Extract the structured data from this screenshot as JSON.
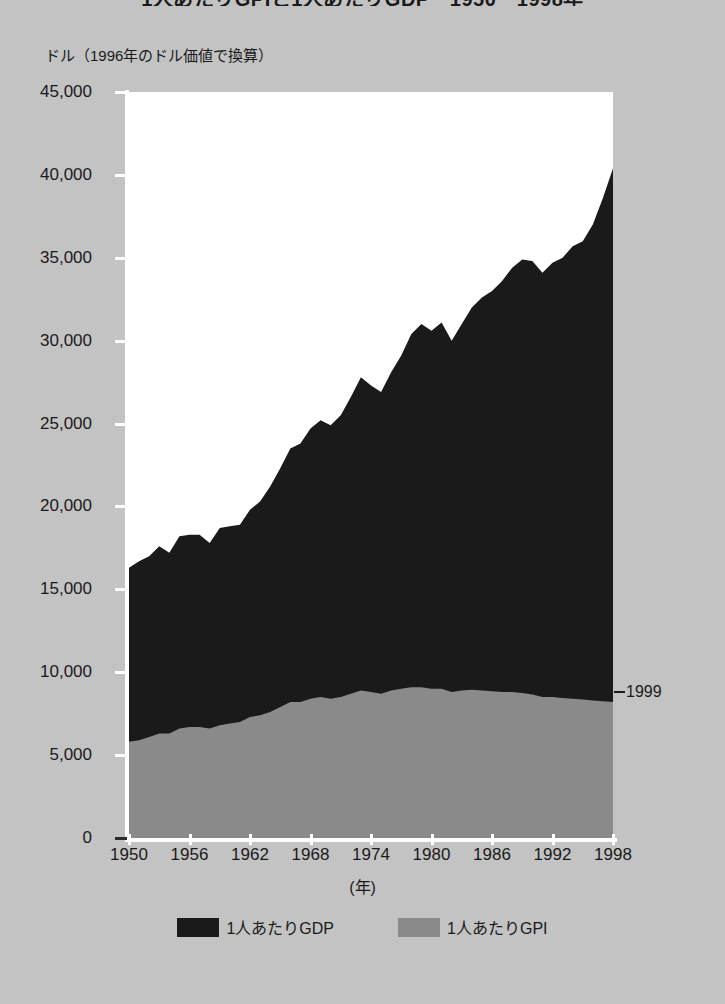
{
  "chart_title": "1人あたりGPIと1人あたりGDP　1950－1998年",
  "y_axis_unit": "ドル（1996年のドル価値で換算）",
  "x_axis_caption": "(年)",
  "annotation": {
    "dash": "",
    "label": "1999"
  },
  "legend": {
    "items": [
      {
        "label": "1人あたりGDP",
        "color": "#1a1a1a",
        "name": "gdp"
      },
      {
        "label": "1人あたりGPI",
        "color": "#8a8a8a",
        "name": "gpi"
      }
    ]
  },
  "colors": {
    "background": "#c3c3c3",
    "plot_background": "#ffffff",
    "gdp_fill": "#1a1a1a",
    "gpi_fill": "#8a8a8a",
    "axis": "#ffffff",
    "text": "#1a1a1a"
  },
  "y_ticks": [
    {
      "value": 45000,
      "label": "45,000"
    },
    {
      "value": 40000,
      "label": "40,000"
    },
    {
      "value": 35000,
      "label": "35,000"
    },
    {
      "value": 30000,
      "label": "30,000"
    },
    {
      "value": 25000,
      "label": "25,000"
    },
    {
      "value": 20000,
      "label": "20,000"
    },
    {
      "value": 15000,
      "label": "15,000"
    },
    {
      "value": 10000,
      "label": "10,000"
    },
    {
      "value": 5000,
      "label": "5,000"
    },
    {
      "value": 0,
      "label": "0"
    }
  ],
  "x_ticks": [
    {
      "value": 1950,
      "label": "1950"
    },
    {
      "value": 1956,
      "label": "1956"
    },
    {
      "value": 1962,
      "label": "1962"
    },
    {
      "value": 1968,
      "label": "1968"
    },
    {
      "value": 1974,
      "label": "1974"
    },
    {
      "value": 1980,
      "label": "1980"
    },
    {
      "value": 1986,
      "label": "1986"
    },
    {
      "value": 1992,
      "label": "1992"
    },
    {
      "value": 1998,
      "label": "1998"
    }
  ],
  "chart_data": {
    "type": "area",
    "title": "1人あたりGPIと1人あたりGDP　1950－1998年",
    "subtitle": "",
    "xlabel": "(年)",
    "ylabel": "ドル（1996年のドル価値で換算）",
    "xlim": [
      1950,
      1998
    ],
    "ylim": [
      0,
      45000
    ],
    "grid": false,
    "legend_position": "bottom",
    "stacked": false,
    "annotations": [
      {
        "text": "1999",
        "x": 1998,
        "y": 8200
      }
    ],
    "x": [
      1950,
      1951,
      1952,
      1953,
      1954,
      1955,
      1956,
      1957,
      1958,
      1959,
      1960,
      1961,
      1962,
      1963,
      1964,
      1965,
      1966,
      1967,
      1968,
      1969,
      1970,
      1971,
      1972,
      1973,
      1974,
      1975,
      1976,
      1977,
      1978,
      1979,
      1980,
      1981,
      1982,
      1983,
      1984,
      1985,
      1986,
      1987,
      1988,
      1989,
      1990,
      1991,
      1992,
      1993,
      1994,
      1995,
      1996,
      1997,
      1998
    ],
    "series": [
      {
        "name": "1人あたりGDP",
        "color": "#1a1a1a",
        "values": [
          16300,
          16700,
          17000,
          17600,
          17200,
          18200,
          18300,
          18300,
          17800,
          18700,
          18800,
          18900,
          19800,
          20300,
          21200,
          22300,
          23500,
          23800,
          24700,
          25200,
          24900,
          25500,
          26600,
          27800,
          27300,
          26900,
          28100,
          29100,
          30400,
          31000,
          30600,
          31100,
          30000,
          31000,
          32900,
          33900,
          34800,
          35700,
          36900,
          37900,
          38100,
          37500,
          38400,
          39000,
          40000,
          40500,
          41900,
          43400,
          44800
        ],
        "values_plot": [
          16300,
          16700,
          17000,
          17600,
          17200,
          18200,
          18300,
          18300,
          17800,
          18700,
          18800,
          18900,
          19800,
          20300,
          21200,
          22300,
          23500,
          23800,
          24700,
          25200,
          24900,
          25500,
          26600,
          27800,
          27300,
          26900,
          28100,
          29100,
          30400,
          31000,
          30600,
          31100,
          30000,
          31000,
          32000,
          32600,
          33000,
          33600,
          34400,
          34900,
          34800,
          34100,
          34700,
          35000,
          35700,
          36000,
          37000,
          38600,
          40400
        ]
      },
      {
        "name": "1人あたりGPI",
        "color": "#8a8a8a",
        "values": [
          5800,
          5900,
          6100,
          6300,
          6300,
          6600,
          6700,
          6700,
          6600,
          6800,
          6900,
          7000,
          7300,
          7400,
          7600,
          7900,
          8200,
          8200,
          8400,
          8500,
          8400,
          8500,
          8700,
          8900,
          8800,
          8700,
          8900,
          9000,
          9100,
          9100,
          9000,
          9000,
          8800,
          8900,
          8950,
          8900,
          8850,
          8800,
          8800,
          8750,
          8650,
          8500,
          8500,
          8450,
          8400,
          8350,
          8300,
          8250,
          8200
        ]
      }
    ]
  }
}
